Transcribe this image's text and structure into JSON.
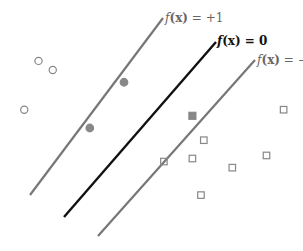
{
  "diagram": {
    "colors": {
      "margin_line": "#777777",
      "decision_line": "#111111",
      "point_outline": "#888888",
      "support_vector_fill": "#888888"
    },
    "lines": [
      {
        "id": "margin-plus",
        "label": "f(x) = +1",
        "label_f": "f",
        "label_x": "(x)",
        "label_rest": " = +1"
      },
      {
        "id": "decision-boundary",
        "label": "f(x) = 0",
        "label_f": "f",
        "label_x": "(x)",
        "label_rest": " = 0"
      },
      {
        "id": "margin-minus",
        "label": "f(x) = −1",
        "label_f": "f",
        "label_x": "(x)",
        "label_rest": " = −1"
      }
    ],
    "class_circles": {
      "marker": "open-circle",
      "points": [
        [
          1,
          6.2
        ],
        [
          1.5,
          5.9
        ],
        [
          0.5,
          4.6
        ]
      ]
    },
    "class_squares": {
      "marker": "open-square",
      "points": [
        [
          9.6,
          4.6
        ],
        [
          6.8,
          3.6
        ],
        [
          5.4,
          2.9
        ],
        [
          6.4,
          3.0
        ],
        [
          7.8,
          2.7
        ],
        [
          9.0,
          3.1
        ],
        [
          6.7,
          1.8
        ]
      ]
    },
    "support_vectors": {
      "circles": [
        [
          4.0,
          5.5
        ],
        [
          2.8,
          4.0
        ]
      ],
      "squares": [
        [
          6.4,
          4.4
        ]
      ]
    }
  }
}
